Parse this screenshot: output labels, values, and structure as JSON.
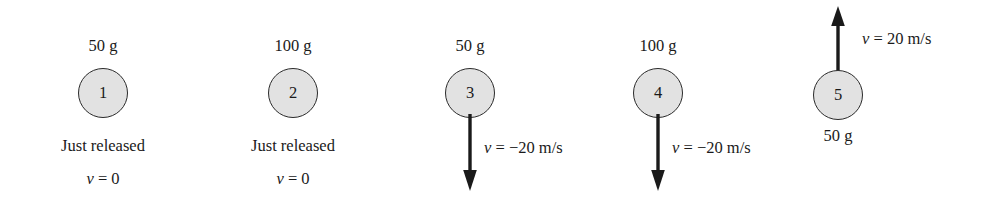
{
  "figure": {
    "type": "physics-free-body-diagram",
    "colors": {
      "circle_fill": "#e2e2e2",
      "circle_stroke": "#2b2b2b",
      "arrow": "#1a1a1a",
      "text": "#1a1a1a",
      "background": "#ffffff"
    }
  },
  "balls": [
    {
      "id": "1",
      "number": "1",
      "mass_label": "50 g",
      "mass_position": "above",
      "status_label": "Just released",
      "velocity_label": "v = 0",
      "velocity_label_position": "below",
      "arrow": "none",
      "cx": 103,
      "cy": 93
    },
    {
      "id": "2",
      "number": "2",
      "mass_label": "100 g",
      "mass_position": "above",
      "status_label": "Just released",
      "velocity_label": "v = 0",
      "velocity_label_position": "below",
      "arrow": "none",
      "cx": 293,
      "cy": 93
    },
    {
      "id": "3",
      "number": "3",
      "mass_label": "50 g",
      "mass_position": "above",
      "status_label": "",
      "velocity_label": "v = −20 m/s",
      "velocity_label_position": "right",
      "arrow": "down",
      "cx": 470,
      "cy": 93
    },
    {
      "id": "4",
      "number": "4",
      "mass_label": "100 g",
      "mass_position": "above",
      "status_label": "",
      "velocity_label": "v = −20 m/s",
      "velocity_label_position": "right",
      "arrow": "down",
      "cx": 658,
      "cy": 93
    },
    {
      "id": "5",
      "number": "5",
      "mass_label": "50 g",
      "mass_position": "below",
      "status_label": "",
      "velocity_label": "v = 20 m/s",
      "velocity_label_position": "right",
      "arrow": "up",
      "cx": 838,
      "cy": 95
    }
  ]
}
